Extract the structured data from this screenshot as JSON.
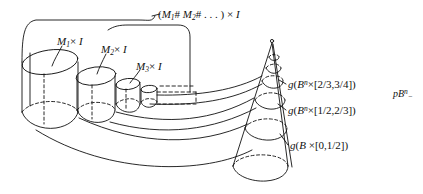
{
  "figure": {
    "type": "mathematical-topology-diagram",
    "background_color": "#ffffff",
    "line_color": "#111111",
    "labels": {
      "top_bracket": {
        "full_text": "(M1# M2# . . . ) × I",
        "open_paren": "(",
        "m1_base": "M",
        "m1_sub": "1",
        "hash1": "#",
        "m2_base": "M",
        "m2_sub": "2",
        "hash2": "#",
        "ellipsis": ". . .",
        "close_paren": ")",
        "times": "×",
        "interval": "I"
      },
      "m1": {
        "full_text": "M1 × I",
        "base": "M",
        "sub": "1",
        "times": "×",
        "interval": "I"
      },
      "m2": {
        "full_text": "M2 × I",
        "base": "M",
        "sub": "2",
        "times": "×",
        "interval": "I"
      },
      "m3": {
        "full_text": "M3 × I",
        "base": "M",
        "sub": "3",
        "times": "×",
        "interval": "I"
      },
      "g_top": {
        "full_text": "g(Bn × [2/3,3/4])",
        "g": "g",
        "open_paren": "(",
        "b": "B",
        "sup": "n",
        "times": "×",
        "bracket": "[2/3,3/4]",
        "close_paren": ")"
      },
      "g_mid": {
        "full_text": "g(Bn × [1/2,2/3])",
        "g": "g",
        "open_paren": "(",
        "b": "B",
        "sup": "n",
        "times": "×",
        "bracket": "[1/2,2/3]",
        "close_paren": ")"
      },
      "g_bottom": {
        "full_text": "g(B × [0,1/2])",
        "g": "g",
        "open_paren": "(",
        "b": "B",
        "sup": "",
        "times": "×",
        "bracket": "[0,1/2]",
        "close_paren": ")"
      },
      "pbn": {
        "full_text": "pBn−",
        "p": "p",
        "b": "B",
        "sup": "n",
        "trail": "−"
      }
    }
  }
}
